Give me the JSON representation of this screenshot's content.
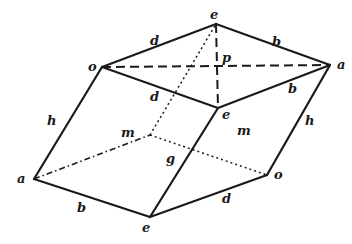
{
  "figure": {
    "type": "parallelepiped (rhombohedron) diagram",
    "stroke_color": "#1a1a1a",
    "background": "#ffffff",
    "vertices": {
      "top_e": [
        216,
        24
      ],
      "left_o": [
        102,
        67
      ],
      "right_a": [
        330,
        65
      ],
      "front_e": [
        218,
        108
      ],
      "hidden_m": [
        150,
        135
      ],
      "bottom_left_a": [
        34,
        179
      ],
      "bottom_e": [
        150,
        217
      ],
      "bottom_right_o": [
        267,
        175
      ],
      "p": [
        217,
        66
      ]
    },
    "labels": [
      {
        "id": "label-e-top",
        "text": "e",
        "x": 210,
        "y": 19
      },
      {
        "id": "label-o-left",
        "text": "o",
        "x": 88,
        "y": 71
      },
      {
        "id": "label-a-right",
        "text": "a",
        "x": 337,
        "y": 69
      },
      {
        "id": "label-d-top",
        "text": "d",
        "x": 150,
        "y": 45
      },
      {
        "id": "label-b-top",
        "text": "b",
        "x": 272,
        "y": 46
      },
      {
        "id": "label-p",
        "text": "p",
        "x": 222,
        "y": 62
      },
      {
        "id": "label-d-mid",
        "text": "d",
        "x": 150,
        "y": 101
      },
      {
        "id": "label-b-mid",
        "text": "b",
        "x": 288,
        "y": 93
      },
      {
        "id": "label-e-front",
        "text": "e",
        "x": 222,
        "y": 119
      },
      {
        "id": "label-h-left",
        "text": "h",
        "x": 47,
        "y": 125
      },
      {
        "id": "label-h-right",
        "text": "h",
        "x": 305,
        "y": 125
      },
      {
        "id": "label-m-hidden",
        "text": "m",
        "x": 121,
        "y": 137
      },
      {
        "id": "label-m-face",
        "text": "m",
        "x": 237,
        "y": 135
      },
      {
        "id": "label-g",
        "text": "g",
        "x": 166,
        "y": 163
      },
      {
        "id": "label-a-bottom",
        "text": "a",
        "x": 17,
        "y": 183
      },
      {
        "id": "label-b-bottom",
        "text": "b",
        "x": 77,
        "y": 212
      },
      {
        "id": "label-e-bottom",
        "text": "e",
        "x": 142,
        "y": 232
      },
      {
        "id": "label-d-bottom",
        "text": "d",
        "x": 222,
        "y": 203
      },
      {
        "id": "label-o-bottom",
        "text": "o",
        "x": 274,
        "y": 179
      }
    ]
  }
}
